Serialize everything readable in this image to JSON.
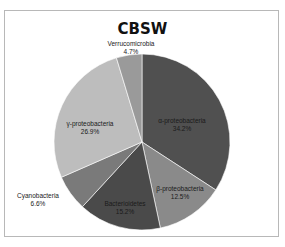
{
  "chart_data": {
    "type": "pie",
    "title": "CBSW",
    "categories": [
      "α-proteobacteria",
      "β-proteobacteria",
      "Bacterioidetes",
      "Cyanobacteria",
      "γ-proteobacteria",
      "Verrucomicrobia"
    ],
    "values": [
      34.2,
      12.5,
      15.2,
      6.6,
      26.9,
      4.7
    ],
    "labels": [
      "34.2%",
      "12.5%",
      "15.2%",
      "6.6%",
      "26.9%",
      "4.7%"
    ],
    "colors": [
      "#505050",
      "#8a8a8a",
      "#4a4a4a",
      "#7a7a7a",
      "#bdbdbd",
      "#9a9a9a"
    ],
    "legend": "none",
    "start_angle_deg": 0,
    "direction": "clockwise"
  },
  "slices": [
    {
      "name": "α-proteobacteria",
      "pct": "34.2%"
    },
    {
      "name": "β-proteobacteria",
      "pct": "12.5%"
    },
    {
      "name": "Bacterioidetes",
      "pct": "15.2%"
    },
    {
      "name": "Cyanobacteria",
      "pct": "6.6%"
    },
    {
      "name": "γ-proteobacteria",
      "pct": "26.9%"
    },
    {
      "name": "Verrucomicrobia",
      "pct": "4.7%"
    }
  ]
}
